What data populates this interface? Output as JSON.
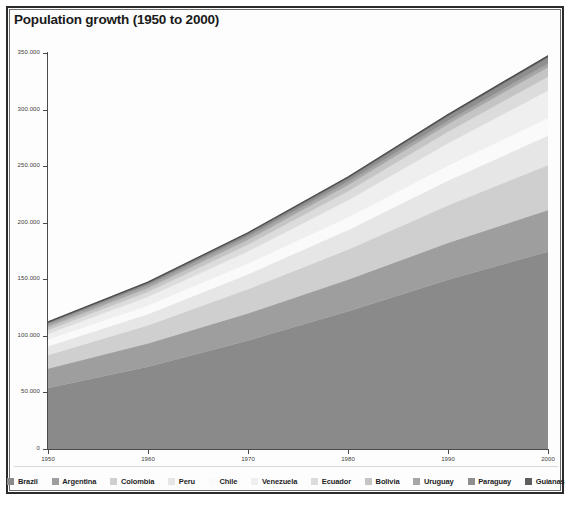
{
  "chart_data": {
    "type": "area",
    "stacked": true,
    "title": "Population growth (1950 to 2000)",
    "xlabel": "",
    "ylabel": "",
    "x": [
      1950,
      1960,
      1970,
      1980,
      1990,
      2000
    ],
    "xtick_labels": [
      "1950",
      "1960",
      "1970",
      "1980",
      "1990",
      "2000"
    ],
    "xlim": [
      1950,
      2000
    ],
    "ylim": [
      0,
      350000
    ],
    "ytick_values": [
      0,
      50000,
      100000,
      150000,
      200000,
      250000,
      300000,
      350000
    ],
    "ytick_labels": [
      "0",
      "50.000",
      "100.000",
      "150.000",
      "200.000",
      "250.000",
      "300.000",
      "350.000"
    ],
    "value_units": "thousands of persons",
    "grid": false,
    "legend_position": "bottom",
    "series": [
      {
        "name": "Brazil",
        "color": "#8a8a8a",
        "values": [
          53975,
          72742,
          95989,
          121672,
          149650,
          174425
        ]
      },
      {
        "name": "Argentina",
        "color": "#9e9e9e",
        "values": [
          17150,
          20616,
          23962,
          28094,
          32581,
          36904
        ]
      },
      {
        "name": "Colombia",
        "color": "#cfcfcf",
        "values": [
          12000,
          16000,
          21360,
          26583,
          33270,
          39764
        ]
      },
      {
        "name": "Peru",
        "color": "#e6e6e6",
        "values": [
          7632,
          9931,
          13193,
          17295,
          21753,
          25939
        ]
      },
      {
        "name": "Chile",
        "color": "#fafafa",
        "values": [
          6082,
          7614,
          9496,
          11174,
          13180,
          15412
        ]
      },
      {
        "name": "Venezuela",
        "color": "#efefef",
        "values": [
          5009,
          7556,
          10721,
          15091,
          19735,
          24348
        ]
      },
      {
        "name": "Ecuador",
        "color": "#dcdcdc",
        "values": [
          3387,
          4439,
          6051,
          7961,
          10264,
          12306
        ]
      },
      {
        "name": "Bolivia",
        "color": "#c4c4c4",
        "values": [
          2714,
          3351,
          4212,
          5355,
          6669,
          8317
        ]
      },
      {
        "name": "Uruguay",
        "color": "#a6a6a6",
        "values": [
          2239,
          2538,
          2808,
          2914,
          3106,
          3321
        ]
      },
      {
        "name": "Paraguay",
        "color": "#8f8f8f",
        "values": [
          1473,
          1842,
          2351,
          3114,
          4219,
          5470
        ]
      },
      {
        "name": "Guianas",
        "color": "#5e5e5e",
        "values": [
          708,
          853,
          1003,
          1155,
          1288,
          1420
        ]
      }
    ]
  },
  "legend": {
    "items": [
      {
        "label": "Brazil"
      },
      {
        "label": "Argentina"
      },
      {
        "label": "Colombia"
      },
      {
        "label": "Peru"
      },
      {
        "label": "Chile"
      },
      {
        "label": "Venezuela"
      },
      {
        "label": "Ecuador"
      },
      {
        "label": "Bolivia"
      },
      {
        "label": "Uruguay"
      },
      {
        "label": "Paraguay"
      },
      {
        "label": "Guianas"
      }
    ]
  },
  "colors": {
    "frame": "#2b2b2b",
    "axis": "#4a4a4a",
    "background": "#fdfdfd",
    "text": "#1a1a1a"
  }
}
